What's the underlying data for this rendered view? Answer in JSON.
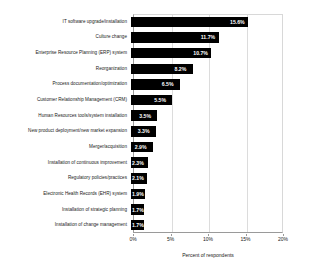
{
  "chart_data": {
    "type": "bar",
    "orientation": "horizontal",
    "title": "",
    "xlabel": "Percent of respondents",
    "ylabel": "",
    "xlim": [
      0,
      20
    ],
    "xticks": [
      "0%",
      "5%",
      "10%",
      "15%",
      "20%"
    ],
    "xtick_values": [
      0,
      5,
      10,
      15,
      20
    ],
    "grid": true,
    "legend": false,
    "bar_color": "#000000",
    "value_label_color": "#ffffff",
    "categories": [
      "IT software upgrade/installation",
      "Culture change",
      "Enterprise Resource Planning (ERP) system",
      "Reorganization",
      "Process documentation/optimization",
      "Customer Relationship Management (CRM)",
      "Human Resources tools/system installation",
      "New product deployment/new market expansion",
      "Merger/acquisition",
      "Installation of continuous improvement",
      "Regulatory policies/practices",
      "Electronic Health Records (EHR) system",
      "Installation of strategic planning",
      "Installation of change management"
    ],
    "values": [
      15.6,
      11.7,
      10.7,
      8.2,
      6.5,
      5.5,
      3.5,
      3.3,
      2.9,
      2.3,
      2.1,
      1.9,
      1.7,
      1.7
    ],
    "value_labels": [
      "15.6%",
      "11.7%",
      "10.7%",
      "8.2%",
      "6.5%",
      "5.5%",
      "3.5%",
      "3.3%",
      "2.9%",
      "2.3%",
      "2.1%",
      "1.9%",
      "1.7%",
      "1.7%"
    ]
  }
}
